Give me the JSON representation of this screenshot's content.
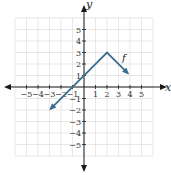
{
  "chart_data": {
    "type": "line",
    "title": "",
    "xlabel": "x",
    "ylabel": "y",
    "xlim": [
      -6,
      6
    ],
    "ylim": [
      -6,
      6
    ],
    "grid": true,
    "x_ticks": [
      -5,
      -4,
      -3,
      -2,
      -1,
      1,
      2,
      3,
      4,
      5
    ],
    "y_ticks": [
      -5,
      -4,
      -3,
      -2,
      -1,
      1,
      2,
      3,
      4,
      5
    ],
    "x_tick_labels": [
      "−5",
      "−4",
      "−3",
      "−2",
      "−1",
      "1",
      "2",
      "3",
      "4",
      "5"
    ],
    "y_tick_labels": [
      "−5",
      "−4",
      "−3",
      "−2",
      "−1",
      "1",
      "2",
      "3",
      "4",
      "5"
    ],
    "series": [
      {
        "name": "f",
        "points": [
          [
            -2.9,
            -1.9
          ],
          [
            2,
            3
          ],
          [
            3.8,
            1.2
          ]
        ],
        "arrows": "both-ends",
        "color": "#3b6e8f"
      }
    ],
    "annotations": [
      {
        "text": "f",
        "x": 3.3,
        "y": 2.3
      }
    ]
  },
  "colors": {
    "grid": "#d9d9d9",
    "axis": "#1a1a1a",
    "line": "#3b6e8f"
  }
}
